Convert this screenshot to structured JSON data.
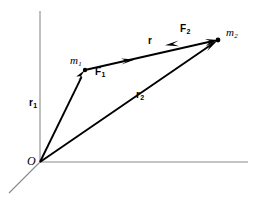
{
  "figure": {
    "kind": "vector-diagram",
    "background_color": "#ffffff",
    "ink_color": "#000000",
    "axis_color": "#8a8a8a",
    "axes": [
      {
        "name": "vertical-axis",
        "x1": 40,
        "y1": 11,
        "x2": 40,
        "y2": 162
      },
      {
        "name": "horizontal-axis",
        "x1": 40,
        "y1": 162,
        "x2": 248,
        "y2": 162
      },
      {
        "name": "depth-axis",
        "x1": 40,
        "y1": 162,
        "x2": 9,
        "y2": 193
      }
    ],
    "points": [
      {
        "name": "origin",
        "label": "O",
        "x": 40,
        "y": 162,
        "dot": false
      },
      {
        "name": "mass-1",
        "label": "m",
        "subscript": "1",
        "x": 85,
        "y": 70,
        "dot": true
      },
      {
        "name": "mass-2",
        "label": "m",
        "subscript": "2",
        "x": 218,
        "y": 40,
        "dot": true
      }
    ],
    "vectors": [
      {
        "name": "position-vector-r1",
        "label": "r",
        "subscript": "1",
        "from": [
          40,
          162
        ],
        "to": [
          85,
          70
        ],
        "label_x": 35,
        "label_y": 104,
        "arrow_at": "end"
      },
      {
        "name": "position-vector-r2",
        "label": "r",
        "subscript": "2",
        "from": [
          40,
          162
        ],
        "to": [
          218,
          40
        ],
        "label_x": 139,
        "label_y": 96,
        "arrow_at": "end"
      },
      {
        "name": "separation-vector-r",
        "label": "r",
        "subscript": "",
        "from": [
          85,
          70
        ],
        "to": [
          218,
          40
        ],
        "label_x": 149,
        "label_y": 40,
        "arrow_at": "end"
      },
      {
        "name": "force-on-mass-1",
        "label": "F",
        "subscript": "1",
        "along": "separation-vector-r",
        "direction": "toward-mass-2",
        "arrow_t": 0.34,
        "label_x": 98,
        "label_y": 72
      },
      {
        "name": "force-on-mass-2",
        "label": "F",
        "subscript": "2",
        "along": "separation-vector-r",
        "direction": "toward-mass-1",
        "arrow_t": 0.77,
        "label_x": 183,
        "label_y": 28
      }
    ],
    "labels": {
      "origin": "O",
      "mass_1": "m",
      "mass_1_sub": "1",
      "mass_2": "m",
      "mass_2_sub": "2",
      "r1": "r",
      "r1_sub": "1",
      "r2": "r",
      "r2_sub": "2",
      "r": "r",
      "f1": "F",
      "f1_sub": "1",
      "f2": "F",
      "f2_sub": "2"
    }
  }
}
